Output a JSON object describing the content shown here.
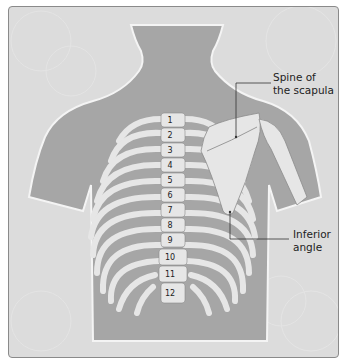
{
  "diagram": {
    "labels": [
      {
        "id": "spine_of_scapula",
        "line1": "Spine of",
        "line2": "the scapula"
      },
      {
        "id": "inferior_angle",
        "line1": "Inferior",
        "line2": "angle"
      }
    ],
    "vertebrae": [
      "1",
      "2",
      "3",
      "4",
      "5",
      "6",
      "7",
      "8",
      "9",
      "10",
      "11",
      "12"
    ],
    "colors": {
      "background": "#dcdcdc",
      "body": "#a6a6a6",
      "bone": "#e6e6e6",
      "bone_outline": "#8c8c8c",
      "leader_line": "#333333"
    }
  }
}
